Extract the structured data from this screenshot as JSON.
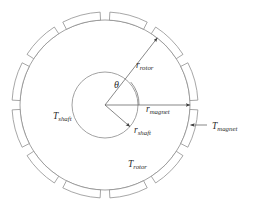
{
  "figure": {
    "type": "engineering-cross-section-diagram",
    "background_color": "#ffffff",
    "line_color": "#8a8a8a",
    "text_color": "#2b2b2b"
  },
  "geometry": {
    "center_x": 105,
    "center_y": 105,
    "shaft_radius": 33,
    "rotor_radius": 85,
    "magnet_outer_radius": 93,
    "magnet_count": 12,
    "magnet_span_degrees": 24,
    "magnet_gap_degrees": 6,
    "theta_degrees": 52
  },
  "labels": {
    "theta": {
      "text": "θ",
      "x": 114,
      "y": 88
    },
    "r_rotor": {
      "base": "r",
      "sub": "rotor",
      "x": 136,
      "y": 68
    },
    "r_magnet": {
      "base": "r",
      "sub": "magnet",
      "x": 146,
      "y": 112
    },
    "r_shaft": {
      "base": "r",
      "sub": "shaft",
      "x": 134,
      "y": 133
    },
    "t_shaft": {
      "base": "T",
      "sub": "shaft",
      "x": 53,
      "y": 119
    },
    "t_rotor": {
      "base": "T",
      "sub": "rotor",
      "x": 128,
      "y": 167
    },
    "t_magnet": {
      "base": "T",
      "sub": "magnet",
      "x": 212,
      "y": 129
    }
  },
  "dimensions": [
    {
      "name": "r_rotor",
      "from": "center",
      "to": "rotor_outer_edge",
      "angle_degrees": 52,
      "arrowhead": "end"
    },
    {
      "name": "r_magnet",
      "from": "center",
      "to": "magnet_outer_edge",
      "angle_degrees": 0,
      "arrowhead": "end"
    },
    {
      "name": "r_shaft",
      "from": "center",
      "to": "shaft_edge",
      "angle_degrees": -41,
      "arrowhead": "end"
    },
    {
      "name": "T_magnet",
      "from": "label",
      "to": "magnet_wall",
      "angle_degrees": 180,
      "arrowhead": "end"
    }
  ]
}
